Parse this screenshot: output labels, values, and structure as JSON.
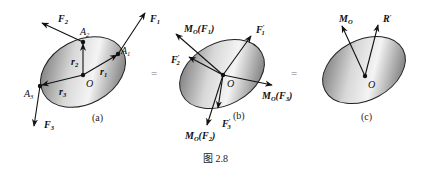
{
  "caption": "图 2.8",
  "equals": "=",
  "panels": [
    {
      "id": "a",
      "sublabel": "(a)",
      "origin": "O",
      "points": [
        "A1",
        "A2",
        "A3"
      ],
      "forces": [
        "F1",
        "F2",
        "F3"
      ],
      "position_vectors": [
        "r1",
        "r2",
        "r3"
      ]
    },
    {
      "id": "b",
      "sublabel": "(b)",
      "origin": "O",
      "translated_forces": [
        "F1'",
        "F2'",
        "F3'"
      ],
      "moments": [
        "MO(F1)",
        "MO(F2)",
        "MO(F3)"
      ]
    },
    {
      "id": "c",
      "sublabel": "(c)",
      "origin": "O",
      "resultant": "R'",
      "resultant_moment": "MO"
    }
  ],
  "labels": {
    "O": "O",
    "A": "A",
    "F": "F",
    "r": "r",
    "M": "M",
    "R": "R",
    "prime": "′",
    "one": "1",
    "two": "2",
    "three": "3",
    "subO": "O",
    "lparen": "(",
    "rparen": ")",
    "sub_a": "(a)",
    "sub_b": "(b)",
    "sub_c": "(c)"
  },
  "colors": {
    "ink": "#111111",
    "body_dark": "#555555",
    "body_light": "#f2f2f2"
  }
}
